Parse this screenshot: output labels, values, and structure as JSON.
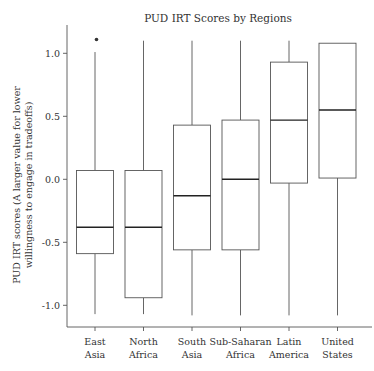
{
  "chart_data": {
    "type": "box",
    "title": "PUD IRT Scores by Regions",
    "xlabel": "",
    "ylabel_lines": [
      "PUD IRT scores (A larger value for lower",
      "willingness to engage in tradeoffs)"
    ],
    "ylim": [
      -1.17,
      1.22
    ],
    "yticks": [
      1.0,
      0.5,
      0.0,
      -0.5,
      -1.0
    ],
    "ytick_labels": [
      "1.0",
      "0.5",
      "0.0",
      "-0.5",
      "-1.0"
    ],
    "grid": false,
    "categories": [
      {
        "lines": [
          "East",
          "Asia"
        ]
      },
      {
        "lines": [
          "North",
          "Africa"
        ]
      },
      {
        "lines": [
          "South",
          "Asia"
        ]
      },
      {
        "lines": [
          "Sub-Saharan",
          "Africa"
        ]
      },
      {
        "lines": [
          "Latin",
          "America"
        ]
      },
      {
        "lines": [
          "United",
          "States"
        ]
      }
    ],
    "series": [
      {
        "name": "East Asia",
        "whisker_low": -1.07,
        "q1": -0.59,
        "median": -0.38,
        "q3": 0.07,
        "whisker_high": 1.01,
        "outliers": [
          1.11
        ]
      },
      {
        "name": "North Africa",
        "whisker_low": -1.07,
        "q1": -0.94,
        "median": -0.38,
        "q3": 0.07,
        "whisker_high": 1.1,
        "outliers": []
      },
      {
        "name": "South Asia",
        "whisker_low": -1.08,
        "q1": -0.56,
        "median": -0.13,
        "q3": 0.43,
        "whisker_high": 1.1,
        "outliers": []
      },
      {
        "name": "Sub-Saharan Africa",
        "whisker_low": -1.08,
        "q1": -0.56,
        "median": 0.0,
        "q3": 0.47,
        "whisker_high": 1.1,
        "outliers": []
      },
      {
        "name": "Latin America",
        "whisker_low": -1.08,
        "q1": -0.03,
        "median": 0.47,
        "q3": 0.93,
        "whisker_high": 1.1,
        "outliers": []
      },
      {
        "name": "United States",
        "whisker_low": -1.08,
        "q1": 0.01,
        "median": 0.55,
        "q3": 1.08,
        "whisker_high": 1.08,
        "outliers": []
      }
    ]
  }
}
